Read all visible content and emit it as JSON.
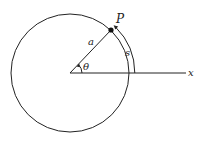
{
  "diagram": {
    "labels": {
      "point": "P",
      "radius": "a",
      "angle": "θ",
      "arc": "s",
      "axis": "x"
    },
    "colors": {
      "stroke": "#222222",
      "background": "#ffffff"
    }
  }
}
